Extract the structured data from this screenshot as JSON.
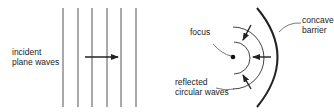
{
  "left_panel": {
    "label_line1": "incident",
    "label_line2": "plane waves",
    "wavefront_x": [
      63,
      78,
      92,
      107,
      121,
      136
    ],
    "arrow_direction": "right"
  },
  "right_panel": {
    "focus_label": "focus",
    "barrier_label_line1": "concave",
    "barrier_label_line2": "barrier",
    "reflected_label_line1": "reflected",
    "reflected_label_line2": "circular waves",
    "arrow_direction": "toward-focus"
  },
  "colors": {
    "line": "#333333",
    "text": "#222222",
    "background": "#ffffff"
  }
}
